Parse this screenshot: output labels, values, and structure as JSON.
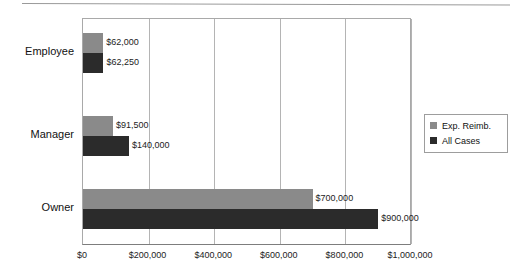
{
  "chart_data": {
    "type": "bar",
    "orientation": "horizontal",
    "title": "",
    "xlabel": "",
    "ylabel": "",
    "categories": [
      "Employee",
      "Manager",
      "Owner"
    ],
    "series": [
      {
        "name": "Exp. Reimb.",
        "color": "#8a8a8a",
        "values": [
          62000,
          91500,
          700000
        ],
        "labels": [
          "$62,000",
          "$91,500",
          "$700,000"
        ]
      },
      {
        "name": "All Cases",
        "color": "#2b2b2b",
        "values": [
          62250,
          140000,
          900000
        ],
        "labels": [
          "$62,250",
          "$140,000",
          "$900,000"
        ]
      }
    ],
    "xlim": [
      0,
      1000000
    ],
    "xticks": [
      0,
      200000,
      400000,
      600000,
      800000,
      1000000
    ],
    "xtick_labels": [
      "$0",
      "$200,000",
      "$400,000",
      "$600,000",
      "$800,000",
      "$1,000,000"
    ],
    "grid": true,
    "grid_axis": "x",
    "legend_position": "right"
  },
  "legend": {
    "entries": [
      {
        "label": "Exp. Reimb.",
        "color": "#8a8a8a"
      },
      {
        "label": "All Cases",
        "color": "#2b2b2b"
      }
    ]
  },
  "colors": {
    "series_light": "#8a8a8a",
    "series_dark": "#2b2b2b",
    "axis": "#a9a9a9",
    "grid": "#b4b4b4",
    "text": "#111111",
    "background": "#ffffff"
  }
}
